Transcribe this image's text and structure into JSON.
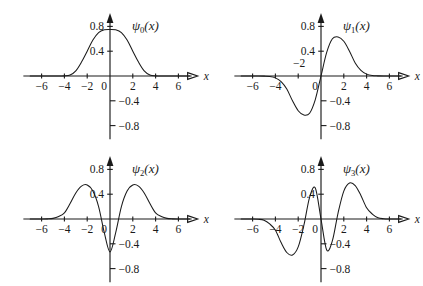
{
  "figure": {
    "background": "#ffffff",
    "stroke_color": "#1a1a1a",
    "panel_count": 4
  },
  "axis": {
    "x_label": "x",
    "x_ticks": [
      "-6",
      "-4",
      "-2",
      "0",
      "2",
      "4",
      "6"
    ],
    "x_tick_values": [
      -6,
      -4,
      -2,
      0,
      2,
      4,
      6
    ],
    "y_ticks_positive": [
      "0.8",
      "0.4"
    ],
    "y_ticks_negative": [
      "-0.4",
      "-0.8"
    ],
    "y_tick_values": [
      0.8,
      0.4,
      -0.4,
      -0.8
    ],
    "xlim": [
      -7.6,
      7.6
    ],
    "ylim": [
      -1.05,
      1.0
    ]
  },
  "panels": [
    {
      "id": "psi0",
      "label_base": "ψ",
      "label_sub": "0",
      "label_arg": "(x)",
      "label_full": "ψ₀(x)",
      "nodes": 0,
      "peak_value": 0.75,
      "peak_x": 0,
      "x_tick_offset_y": 14,
      "zero_label_left": true,
      "minus_two_raised": false
    },
    {
      "id": "psi1",
      "label_base": "ψ",
      "label_sub": "1",
      "label_arg": "(x)",
      "label_full": "ψ₁(x)",
      "nodes": 1,
      "peak_value": 0.63,
      "peak_x": 1.0,
      "x_tick_offset_y": 14,
      "zero_label_left": true,
      "minus_two_raised": true
    },
    {
      "id": "psi2",
      "label_base": "ψ",
      "label_sub": "2",
      "label_arg": "(x)",
      "label_full": "ψ₂(x)",
      "nodes": 2,
      "peak_value": 0.55,
      "peak_x": 1.55,
      "x_tick_offset_y": 14,
      "zero_label_left": true,
      "minus_two_raised": false
    },
    {
      "id": "psi3",
      "label_base": "ψ",
      "label_sub": "3",
      "label_arg": "(x)",
      "label_full": "ψ₃(x)",
      "nodes": 3,
      "peak_value": 0.56,
      "peak_x": 2.0,
      "x_tick_offset_y": 14,
      "zero_label_left": true,
      "minus_two_raised": false
    }
  ],
  "chart_data": [
    {
      "type": "line",
      "title": "ψ₀(x)",
      "xlabel": "x",
      "ylabel": "",
      "xlim": [
        -7.6,
        7.6
      ],
      "ylim": [
        -1.05,
        1.0
      ],
      "grid": false,
      "legend": "none",
      "x": [
        -7,
        -6.5,
        -6,
        -5.5,
        -5,
        -4.5,
        -4,
        -3.5,
        -3,
        -2.5,
        -2,
        -1.5,
        -1,
        -0.5,
        0,
        0.5,
        1,
        1.5,
        2,
        2.5,
        3,
        3.5,
        4,
        4.5,
        5,
        5.5,
        6,
        6.5,
        7
      ],
      "y": [
        0.0,
        0.0,
        0.0,
        0.0,
        0.0,
        0.001,
        0.002,
        0.016,
        0.083,
        0.225,
        0.4,
        0.58,
        0.7,
        0.745,
        0.751,
        0.745,
        0.7,
        0.58,
        0.4,
        0.225,
        0.083,
        0.016,
        0.002,
        0.001,
        0.0,
        0.0,
        0.0,
        0.0,
        0.0
      ]
    },
    {
      "type": "line",
      "title": "ψ₁(x)",
      "xlabel": "x",
      "ylabel": "",
      "xlim": [
        -7.6,
        7.6
      ],
      "ylim": [
        -1.05,
        1.0
      ],
      "grid": false,
      "legend": "none",
      "x": [
        -7,
        -6.5,
        -6,
        -5.5,
        -5,
        -4.5,
        -4,
        -3.5,
        -3,
        -2.5,
        -2,
        -1.5,
        -1,
        -0.5,
        0,
        0.5,
        1,
        1.5,
        2,
        2.5,
        3,
        3.5,
        4,
        4.5,
        5,
        5.5,
        6,
        6.5,
        7
      ],
      "y": [
        0.0,
        0.0,
        0.0,
        0.0,
        -0.002,
        -0.007,
        -0.03,
        -0.09,
        -0.21,
        -0.4,
        -0.56,
        -0.63,
        -0.6,
        -0.38,
        0.0,
        0.38,
        0.6,
        0.63,
        0.56,
        0.4,
        0.21,
        0.09,
        0.03,
        0.007,
        0.002,
        0.0,
        0.0,
        0.0,
        0.0
      ]
    },
    {
      "type": "line",
      "title": "ψ₂(x)",
      "xlabel": "x",
      "ylabel": "",
      "xlim": [
        -7.6,
        7.6
      ],
      "ylim": [
        -1.05,
        1.0
      ],
      "grid": false,
      "legend": "none",
      "x": [
        -7,
        -6.5,
        -6,
        -5.5,
        -5,
        -4.5,
        -4,
        -3.5,
        -3,
        -2.5,
        -2,
        -1.5,
        -1,
        -0.5,
        0,
        0.5,
        1,
        1.5,
        2,
        2.5,
        3,
        3.5,
        4,
        4.5,
        5,
        5.5,
        6,
        6.5,
        7
      ],
      "y": [
        0.0,
        0.0,
        0.0,
        0.002,
        0.01,
        0.04,
        0.1,
        0.25,
        0.42,
        0.53,
        0.55,
        0.45,
        0.2,
        -0.22,
        -0.53,
        -0.22,
        0.2,
        0.45,
        0.55,
        0.53,
        0.42,
        0.25,
        0.1,
        0.04,
        0.01,
        0.002,
        0.0,
        0.0,
        0.0
      ]
    },
    {
      "type": "line",
      "title": "ψ₃(x)",
      "xlabel": "x",
      "ylabel": "",
      "xlim": [
        -7.6,
        7.6
      ],
      "ylim": [
        -1.05,
        1.0
      ],
      "grid": false,
      "legend": "none",
      "x": [
        -7,
        -6.5,
        -6,
        -5.5,
        -5,
        -4.5,
        -4,
        -3.5,
        -3,
        -2.5,
        -2,
        -1.5,
        -1,
        -0.5,
        0,
        0.5,
        1,
        1.5,
        2,
        2.5,
        3,
        3.5,
        4,
        4.5,
        5,
        5.5,
        6,
        6.5,
        7
      ],
      "y": [
        0.0,
        0.0,
        0.0,
        -0.004,
        -0.02,
        -0.08,
        -0.18,
        -0.38,
        -0.54,
        -0.58,
        -0.45,
        -0.1,
        0.35,
        0.5,
        0.0,
        -0.5,
        -0.35,
        0.1,
        0.45,
        0.58,
        0.54,
        0.38,
        0.18,
        0.08,
        0.02,
        0.004,
        0.0,
        0.0,
        0.0
      ]
    }
  ]
}
